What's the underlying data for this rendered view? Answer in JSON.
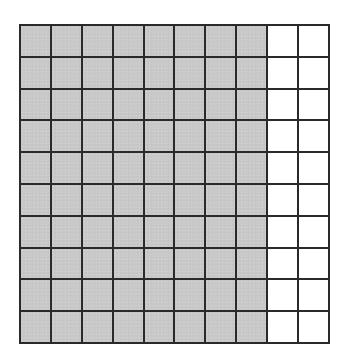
{
  "diagram": {
    "type": "hundred-grid",
    "rows": 10,
    "columns": 10,
    "shaded_columns": 8,
    "shaded_count": 80,
    "total_cells": 100,
    "shaded_fraction": "80/100",
    "colors": {
      "shaded": "#c9c9c9",
      "unshaded": "#ffffff",
      "grid_line": "#2a2a2a"
    }
  }
}
